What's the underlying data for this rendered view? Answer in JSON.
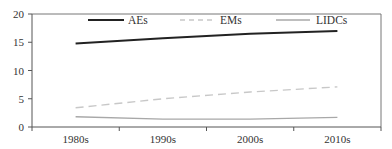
{
  "chart_data": {
    "type": "line",
    "title": "",
    "xlabel": "",
    "ylabel": "",
    "categories": [
      "1980s",
      "1990s",
      "2000s",
      "2010s"
    ],
    "series": [
      {
        "name": "AEs",
        "values": [
          14.8,
          15.7,
          16.5,
          17.0
        ],
        "color": "#222222",
        "style": "solid",
        "width": 2
      },
      {
        "name": "EMs",
        "values": [
          3.4,
          5.0,
          6.2,
          7.1
        ],
        "color": "#c8c8c8",
        "style": "dashed",
        "width": 1.4
      },
      {
        "name": "LIDCs",
        "values": [
          1.8,
          1.4,
          1.4,
          1.7
        ],
        "color": "#a8a8a8",
        "style": "solid",
        "width": 1.4
      }
    ],
    "ylim": [
      0,
      20
    ],
    "yticks": [
      0,
      5,
      10,
      15,
      20
    ],
    "grid": false,
    "legend_position": "top-inside"
  }
}
